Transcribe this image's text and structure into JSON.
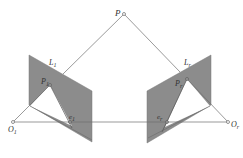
{
  "diagram": {
    "type": "epipolar-geometry",
    "colors": {
      "plane_fill": "#8c8c8c",
      "line": "#6e6e6e",
      "point": "#666666",
      "background": "#ffffff"
    },
    "labels": {
      "P": {
        "main": "P",
        "sub": ""
      },
      "L_left": {
        "main": "L",
        "sub": "1"
      },
      "L_right": {
        "main": "L",
        "sub": "r"
      },
      "P_left": {
        "main": "P",
        "sub": "1"
      },
      "P_right": {
        "main": "P",
        "sub": "r"
      },
      "e_left": {
        "main": "e",
        "sub": "1"
      },
      "e_right": {
        "main": "e",
        "sub": "r"
      },
      "O_left": {
        "main": "O",
        "sub": "1"
      },
      "O_right": {
        "main": "O",
        "sub": "r"
      }
    }
  }
}
